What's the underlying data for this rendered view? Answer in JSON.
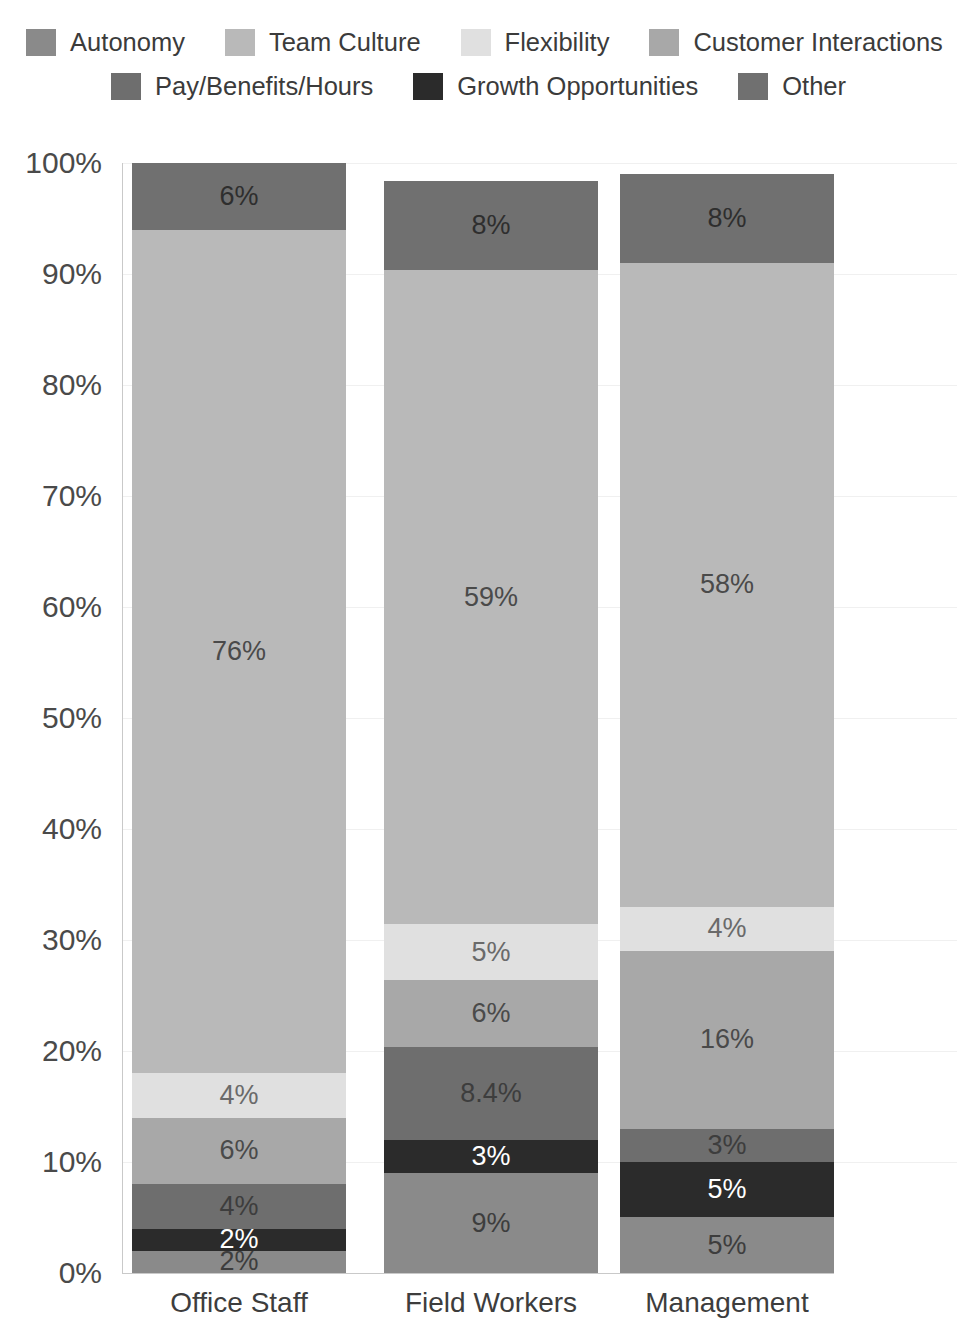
{
  "legend": {
    "rows": [
      [
        {
          "label": "Autonomy",
          "color": "#8a8a8a",
          "key": "autonomy"
        },
        {
          "label": "Team Culture",
          "color": "#b9b9b9",
          "key": "team-culture"
        },
        {
          "label": "Flexibility",
          "color": "#e0e0e0",
          "key": "flexibility"
        },
        {
          "label": "Customer Interactions",
          "color": "#a8a8a8",
          "key": "customer-interactions"
        }
      ],
      [
        {
          "label": "Pay/Benefits/Hours",
          "color": "#6e6e6e",
          "key": "pay-benefits-hours"
        },
        {
          "label": "Growth Opportunities",
          "color": "#2b2b2b",
          "key": "growth-opportunities"
        },
        {
          "label": "Other",
          "color": "#707070",
          "key": "other"
        }
      ]
    ]
  },
  "axis": {
    "yticks": [
      "0%",
      "10%",
      "20%",
      "30%",
      "40%",
      "50%",
      "60%",
      "70%",
      "80%",
      "90%",
      "100%"
    ],
    "ytick_values": [
      0,
      10,
      20,
      30,
      40,
      50,
      60,
      70,
      80,
      90,
      100
    ]
  },
  "chart_data": {
    "type": "bar",
    "stacked": true,
    "title": "",
    "xlabel": "",
    "ylabel": "",
    "ylim": [
      0,
      100
    ],
    "grid": true,
    "legend_position": "top",
    "categories": [
      "Office Staff",
      "Field Workers",
      "Management"
    ],
    "series": [
      {
        "name": "Autonomy",
        "color": "#8a8a8a",
        "text_color": "#3d3d3d",
        "values": [
          2,
          9,
          5
        ],
        "labels": [
          "2%",
          "9%",
          "5%"
        ]
      },
      {
        "name": "Growth Opportunities",
        "color": "#2b2b2b",
        "text_color": "#ffffff",
        "values": [
          2,
          3,
          5
        ],
        "labels": [
          "2%",
          "3%",
          "5%"
        ]
      },
      {
        "name": "Pay/Benefits/Hours",
        "color": "#6e6e6e",
        "text_color": "#3d3d3d",
        "values": [
          4,
          8.4,
          3
        ],
        "labels": [
          "4%",
          "8.4%",
          "3%"
        ]
      },
      {
        "name": "Customer Interactions",
        "color": "#a8a8a8",
        "text_color": "#4a4a4a",
        "values": [
          6,
          6,
          16
        ],
        "labels": [
          "6%",
          "6%",
          "16%"
        ]
      },
      {
        "name": "Flexibility",
        "color": "#e0e0e0",
        "text_color": "#6a6a6a",
        "values": [
          4,
          5,
          4
        ],
        "labels": [
          "4%",
          "5%",
          "4%"
        ]
      },
      {
        "name": "Team Culture",
        "color": "#b9b9b9",
        "text_color": "#4a4a4a",
        "values": [
          76,
          59,
          58
        ],
        "labels": [
          "76%",
          "59%",
          "58%"
        ]
      },
      {
        "name": "Other",
        "color": "#707070",
        "text_color": "#2e2e2e",
        "values": [
          6,
          8,
          8
        ],
        "labels": [
          "6%",
          "8%",
          "8%"
        ]
      }
    ]
  }
}
